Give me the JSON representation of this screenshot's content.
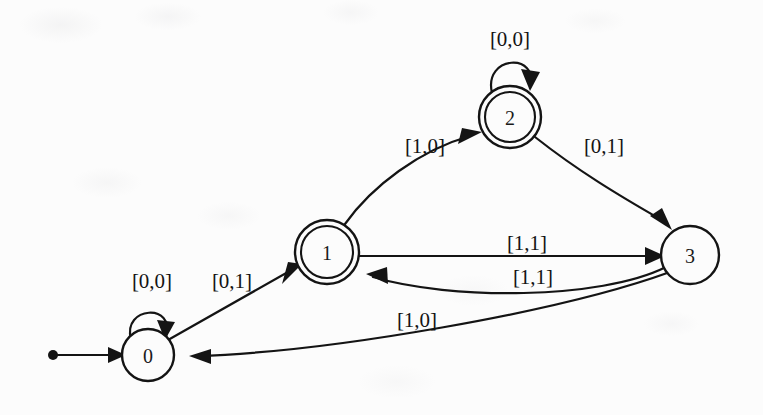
{
  "diagram": {
    "type": "state-transition-diagram",
    "background_color": "#fcfcfc",
    "ink_color": "#141414"
  },
  "states": [
    {
      "id": "0",
      "label": "0",
      "accepting": false,
      "initial": true,
      "cx": 148,
      "cy": 355,
      "r": 26
    },
    {
      "id": "1",
      "label": "1",
      "accepting": true,
      "initial": false,
      "cx": 327,
      "cy": 252,
      "r": 32
    },
    {
      "id": "2",
      "label": "2",
      "accepting": true,
      "initial": false,
      "cx": 510,
      "cy": 117,
      "r": 31
    },
    {
      "id": "3",
      "label": "3",
      "accepting": false,
      "initial": false,
      "cx": 690,
      "cy": 255,
      "r": 29
    }
  ],
  "transitions": [
    {
      "id": "t-start",
      "from": "start",
      "to": "0",
      "label": "",
      "kind": "initial-arrow"
    },
    {
      "id": "t-0-0",
      "from": "0",
      "to": "0",
      "label": "[0,0]",
      "kind": "self-loop",
      "label_x": 152,
      "label_y": 281
    },
    {
      "id": "t-0-1",
      "from": "0",
      "to": "1",
      "label": "[0,1]",
      "kind": "straight",
      "label_x": 232,
      "label_y": 281
    },
    {
      "id": "t-1-2",
      "from": "1",
      "to": "2",
      "label": "[1,0]",
      "kind": "curve",
      "label_x": 425,
      "label_y": 146
    },
    {
      "id": "t-2-2",
      "from": "2",
      "to": "2",
      "label": "[0,0]",
      "kind": "self-loop",
      "label_x": 510,
      "label_y": 39
    },
    {
      "id": "t-2-3",
      "from": "2",
      "to": "3",
      "label": "[0,1]",
      "kind": "curve",
      "label_x": 604,
      "label_y": 146
    },
    {
      "id": "t-1-3",
      "from": "1",
      "to": "3",
      "label": "[1,1]",
      "kind": "straight",
      "label_x": 527,
      "label_y": 243
    },
    {
      "id": "t-3-1",
      "from": "3",
      "to": "1",
      "label": "[1,1]",
      "kind": "curve",
      "label_x": 533,
      "label_y": 277
    },
    {
      "id": "t-3-0",
      "from": "3",
      "to": "0",
      "label": "[1,0]",
      "kind": "curve",
      "label_x": 417,
      "label_y": 320
    }
  ],
  "start_marker": {
    "dot_x": 53,
    "dot_y": 355,
    "line_to_x": 122,
    "line_to_y": 355
  }
}
